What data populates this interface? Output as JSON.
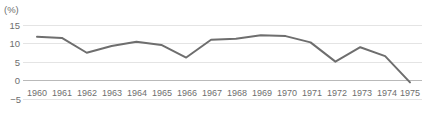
{
  "chart_data": {
    "type": "line",
    "title": "",
    "subtitle": "",
    "xlabel": "",
    "ylabel": "(%)",
    "unit_label": "(%)",
    "categories": [
      "1960",
      "1961",
      "1962",
      "1963",
      "1964",
      "1965",
      "1966",
      "1967",
      "1968",
      "1969",
      "1970",
      "1971",
      "1972",
      "1973",
      "1974",
      "1975"
    ],
    "x": [
      1960,
      1961,
      1962,
      1963,
      1964,
      1965,
      1966,
      1967,
      1968,
      1969,
      1970,
      1971,
      1972,
      1973,
      1974,
      1975
    ],
    "values": [
      11.8,
      11.5,
      7.5,
      9.3,
      10.5,
      9.6,
      6.2,
      11.0,
      11.3,
      12.2,
      12.0,
      10.3,
      5.1,
      9.0,
      6.6,
      -0.5
    ],
    "series": [
      {
        "name": "",
        "values": [
          11.8,
          11.5,
          7.5,
          9.3,
          10.5,
          9.6,
          6.2,
          11.0,
          11.3,
          12.2,
          12.0,
          10.3,
          5.1,
          9.0,
          6.6,
          -0.5
        ]
      }
    ],
    "ytick_labels": [
      "15",
      "10",
      "5",
      "0",
      "−5"
    ],
    "ytick_values": [
      15,
      10,
      5,
      0,
      -5
    ],
    "ylim": [
      -5,
      15
    ],
    "xlim": [
      1960,
      1975
    ],
    "grid": true,
    "legend": false,
    "legend_position": "none",
    "line_color": "#6e6e6e",
    "grid_color": "#e4e4e4",
    "zero_axis_color": "#b9b9b9",
    "text_color": "#6e6e6e",
    "background_color": "#ffffff"
  },
  "axis": {
    "unit": "(%)",
    "yticks": [
      {
        "label": "15",
        "value": 15
      },
      {
        "label": "10",
        "value": 10
      },
      {
        "label": "5",
        "value": 5
      },
      {
        "label": "0",
        "value": 0
      },
      {
        "label": "−5",
        "value": -5
      }
    ],
    "xticks": [
      {
        "label": "1960"
      },
      {
        "label": "1961"
      },
      {
        "label": "1962"
      },
      {
        "label": "1963"
      },
      {
        "label": "1964"
      },
      {
        "label": "1965"
      },
      {
        "label": "1966"
      },
      {
        "label": "1967"
      },
      {
        "label": "1968"
      },
      {
        "label": "1969"
      },
      {
        "label": "1970"
      },
      {
        "label": "1971"
      },
      {
        "label": "1972"
      },
      {
        "label": "1973"
      },
      {
        "label": "1974"
      },
      {
        "label": "1975"
      }
    ]
  }
}
